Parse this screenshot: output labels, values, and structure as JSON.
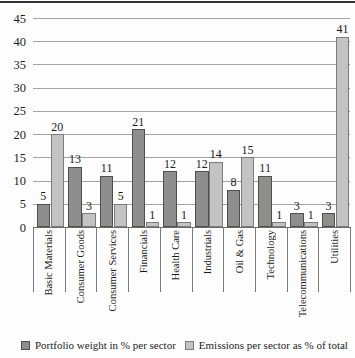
{
  "chart_data": {
    "type": "bar",
    "categories": [
      "Basic Materials",
      "Consumer Goods",
      "Consumer Services",
      "Financials",
      "Health Care",
      "Industrials",
      "Oil & Gas",
      "Technology",
      "Telecommunications",
      "Utilities"
    ],
    "series": [
      {
        "name": "Portfolio weight in % per sector",
        "values": [
          5,
          13,
          11,
          21,
          12,
          12,
          8,
          11,
          3,
          3
        ],
        "fill": "#8e8e8e",
        "border": "#514f4c"
      },
      {
        "name": "Emissions per sector as % of total",
        "values": [
          20,
          3,
          5,
          1,
          1,
          14,
          15,
          1,
          1,
          41
        ],
        "fill": "#c3c3c3",
        "border": "#7b7b7b"
      }
    ],
    "ylim": [
      0,
      45
    ],
    "yticks": [
      0,
      5,
      10,
      15,
      20,
      25,
      30,
      35,
      40,
      45
    ],
    "grid": true,
    "value_labels_shown": true,
    "legend_position": "bottom",
    "gridline_color": "#a3a3a3",
    "axis_color": "#6b6b6b"
  }
}
